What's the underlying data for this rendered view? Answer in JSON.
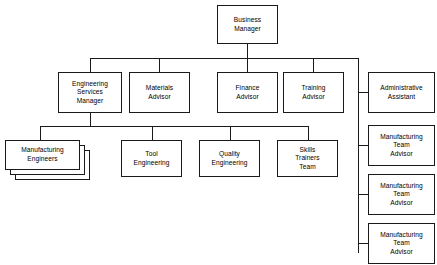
{
  "chart": {
    "type": "org-chart",
    "line_color": "#1a1a1a",
    "box_fill": "#ffffff",
    "background": "#ffffff"
  },
  "nodes": {
    "business_manager": "Business\nManager",
    "engineering_services_manager": "Engineering\nServices\nManager",
    "materials_advisor": "Materials\nAdvisor",
    "finance_advisor": "Finance\nAdvisor",
    "training_advisor": "Training\nAdvisor",
    "administrative_assistant": "Administrative\nAssistant",
    "manufacturing_engineers": "Manufacturing\nEngineers",
    "tool_engineering": "Tool\nEngineering",
    "quality_engineering": "Quality\nEngineering",
    "skills_trainers_team": "Skills\nTrainers\nTeam",
    "manufacturing_team_advisor_1": "Manufacturing\nTeam\nAdvisor",
    "manufacturing_team_advisor_2": "Manufacturing\nTeam\nAdvisor",
    "manufacturing_team_advisor_3": "Manufacturing\nTeam\nAdvisor"
  },
  "hierarchy": {
    "root": "Business Manager",
    "level_2": [
      "Engineering Services Manager",
      "Materials Advisor",
      "Finance Advisor",
      "Training Advisor",
      "Administrative Assistant"
    ],
    "level_3_under_engineering_services_manager": [
      "Manufacturing Engineers",
      "Tool Engineering",
      "Quality Engineering",
      "Skills Trainers Team"
    ],
    "right_column_under_business_manager": [
      "Administrative Assistant",
      "Manufacturing Team Advisor",
      "Manufacturing Team Advisor",
      "Manufacturing Team Advisor"
    ],
    "multi_instance_nodes": [
      "Manufacturing Engineers"
    ]
  }
}
